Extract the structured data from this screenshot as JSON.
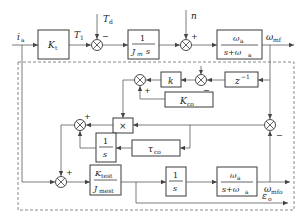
{
  "diagram": {
    "type": "block-diagram",
    "signals": {
      "input": "i",
      "input_sub": "a",
      "torque": "T",
      "torque_sub": "1",
      "disturbance": "T",
      "disturbance_sub": "d",
      "noise": "n",
      "output_top": "ω",
      "output_top_sub": "mf",
      "output_bottom": "ω",
      "output_bottom_sub": "mfo",
      "error": "ε",
      "error_sub": "o"
    },
    "blocks": {
      "kt": {
        "main": "K",
        "sub": "t"
      },
      "inertia": {
        "num": "1",
        "den_main": "J",
        "den_sub": "m",
        "den_tail": "s"
      },
      "filter_top": {
        "num_main": "ω",
        "num_sub": "a",
        "den_main": "s+ω",
        "den_sub": "a"
      },
      "delay": {
        "main": "z",
        "sup": "−1"
      },
      "k": {
        "main": "k"
      },
      "kco": {
        "main": "K",
        "sub": "co"
      },
      "mult": {
        "main": "×"
      },
      "integrator1": {
        "num": "1",
        "den": "s"
      },
      "tau": {
        "main": "τ",
        "sub": "co"
      },
      "est": {
        "num_main": "K",
        "num_sub": "test",
        "den_main": "J",
        "den_sub": "mest"
      },
      "integrator2": {
        "num": "1",
        "den": "s"
      },
      "filter_bottom": {
        "num_main": "ω",
        "num_sub": "a",
        "den_main": "s+ω",
        "den_sub": "a"
      }
    },
    "signs": {
      "sum_torque_disturbance": "−",
      "sum_noise": "+",
      "sum_delay_minus": "−",
      "sum_k_kco_plus": "+",
      "sum_mult_plus": "+",
      "sum_est_plus": "+",
      "sum_error_minus": "−"
    }
  }
}
